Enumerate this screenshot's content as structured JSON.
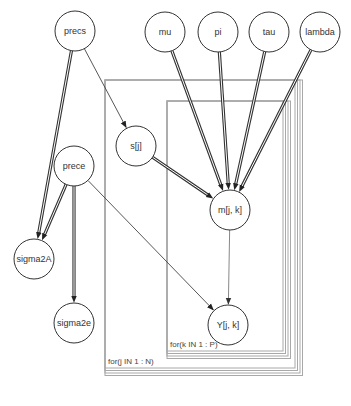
{
  "diagram": {
    "type": "directed-graphical-model",
    "nodes": [
      {
        "id": "precs",
        "label": "precs",
        "x": 75,
        "y": 31,
        "r": 20
      },
      {
        "id": "mu",
        "label": "mu",
        "x": 165,
        "y": 32,
        "r": 20
      },
      {
        "id": "pi",
        "label": "pi",
        "x": 218,
        "y": 32,
        "r": 20
      },
      {
        "id": "tau",
        "label": "tau",
        "x": 269,
        "y": 32,
        "r": 20
      },
      {
        "id": "lambda",
        "label": "lambda",
        "x": 320,
        "y": 32,
        "r": 20
      },
      {
        "id": "s",
        "label": "s[j]",
        "x": 136,
        "y": 146,
        "r": 20
      },
      {
        "id": "prece",
        "label": "prece",
        "x": 74,
        "y": 166,
        "r": 20
      },
      {
        "id": "m",
        "label": "m[j, k]",
        "x": 230,
        "y": 210,
        "r": 20
      },
      {
        "id": "sigma2A",
        "label": "sigma2A",
        "x": 34,
        "y": 259,
        "r": 20
      },
      {
        "id": "sigma2e",
        "label": "sigma2e",
        "x": 74,
        "y": 323,
        "r": 20
      },
      {
        "id": "Y",
        "label": "Y[j, k]",
        "x": 228,
        "y": 325,
        "r": 20
      }
    ],
    "edges": [
      {
        "from": "precs",
        "to": "sigma2A",
        "style": "double"
      },
      {
        "from": "precs",
        "to": "s",
        "style": "single"
      },
      {
        "from": "mu",
        "to": "m",
        "style": "double"
      },
      {
        "from": "pi",
        "to": "m",
        "style": "double"
      },
      {
        "from": "tau",
        "to": "m",
        "style": "double"
      },
      {
        "from": "lambda",
        "to": "m",
        "style": "double"
      },
      {
        "from": "s",
        "to": "m",
        "style": "double"
      },
      {
        "from": "prece",
        "to": "sigma2A",
        "style": "double"
      },
      {
        "from": "prece",
        "to": "sigma2e",
        "style": "double"
      },
      {
        "from": "prece",
        "to": "Y",
        "style": "single"
      },
      {
        "from": "m",
        "to": "Y",
        "style": "gray"
      }
    ],
    "plates": [
      {
        "id": "plate-j",
        "label": "for(j IN 1 : N)",
        "x": 105,
        "y": 80,
        "w": 190,
        "h": 288,
        "stack": 4
      },
      {
        "id": "plate-k",
        "label": "for(k IN 1 : P)",
        "x": 167,
        "y": 101,
        "w": 116,
        "h": 250,
        "stack": 4
      }
    ]
  }
}
